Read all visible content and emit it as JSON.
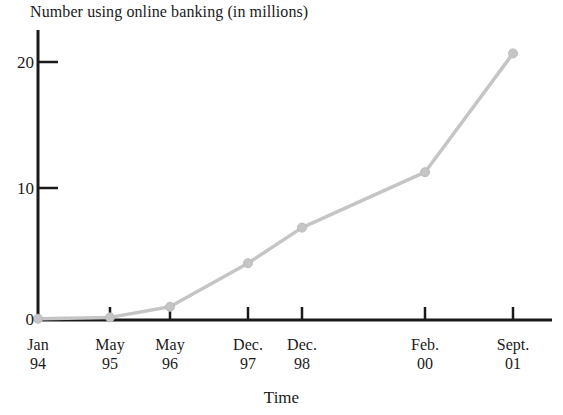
{
  "chart_data": {
    "type": "line",
    "title": "Number using online banking (in millions)",
    "xlabel": "Time",
    "ylabel": "",
    "categories": [
      "Jan 94",
      "May 95",
      "May 96",
      "Dec. 97",
      "Dec. 98",
      "Feb. 00",
      "Sept. 01"
    ],
    "x_tick_labels": [
      {
        "month": "Jan",
        "year": "94"
      },
      {
        "month": "May",
        "year": "95"
      },
      {
        "month": "May",
        "year": "96"
      },
      {
        "month": "Dec.",
        "year": "97"
      },
      {
        "month": "Dec.",
        "year": "98"
      },
      {
        "month": "Feb.",
        "year": "00"
      },
      {
        "month": "Sept.",
        "year": "01"
      }
    ],
    "values": [
      0.1,
      0.2,
      1.0,
      4.3,
      7.0,
      11.2,
      20.2
    ],
    "y_tick_labels": [
      "0",
      "10",
      "20"
    ],
    "y_tick_values": [
      0,
      10,
      20
    ],
    "ylim": [
      0,
      22.5
    ],
    "grid": false,
    "legend": false,
    "series_color": "#c5c5c5",
    "axis_color": "#1a1a1a",
    "marker": "circle"
  }
}
